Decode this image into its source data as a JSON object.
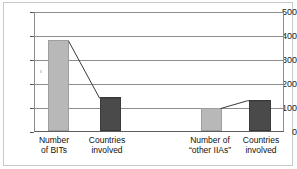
{
  "chart_data": {
    "type": "bar",
    "title": "",
    "subtitle": "",
    "xlabel": "",
    "ylabel": "",
    "ylim": [
      0,
      500
    ],
    "yticks": [
      "0",
      "100",
      "200",
      "300",
      "400",
      "500"
    ],
    "ytick_values": [
      0,
      100,
      200,
      300,
      400,
      500
    ],
    "grid": true,
    "legend": "none",
    "categories": [
      "Number of BITs",
      "Countries involved",
      "Number of “other IIAs”",
      "Countries involved"
    ],
    "category_lines": [
      [
        "Number",
        "of BITs"
      ],
      [
        "Countries",
        "involved"
      ],
      [
        "Number of",
        "“other IIAs”"
      ],
      [
        "Countries",
        "involved"
      ]
    ],
    "values": [
      380,
      140,
      95,
      128
    ],
    "bar_colors": [
      "#b8b8b8",
      "#4a4a4a",
      "#b8b8b8",
      "#4a4a4a"
    ],
    "connectors": [
      {
        "from_index": 0,
        "to_index": 1
      },
      {
        "from_index": 2,
        "to_index": 3
      }
    ],
    "connector_color": "#3a3a3a",
    "axis_color": "#8d8d8d",
    "plot_background": "#ffffff",
    "figure_background": "#ffffff",
    "frame_color": "#c9c9c9"
  }
}
